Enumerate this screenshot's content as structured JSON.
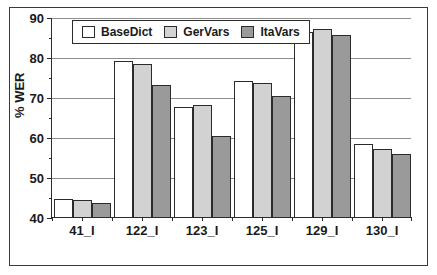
{
  "chart_data": {
    "type": "bar",
    "title": "",
    "subtitle": "",
    "xlabel": "",
    "ylabel": "% WER",
    "ylim": [
      40,
      90
    ],
    "ytick_step": 10,
    "yticks": [
      40,
      50,
      60,
      70,
      80,
      90
    ],
    "ytick_labels": [
      "40",
      "50",
      "60",
      "70",
      "80",
      "90"
    ],
    "grid": "horizontal",
    "legend_position": "top-left-inside",
    "categories": [
      "41_I",
      "122_I",
      "123_I",
      "125_I",
      "129_I",
      "130_I"
    ],
    "series": [
      {
        "name": "BaseDict",
        "color": "#ffffff",
        "values": [
          44.5,
          79.0,
          67.5,
          74.0,
          86.3,
          58.2
        ]
      },
      {
        "name": "GerVars",
        "color": "#d2d2d2",
        "values": [
          44.2,
          78.3,
          68.0,
          73.5,
          87.0,
          57.0
        ]
      },
      {
        "name": "ItaVars",
        "color": "#9a9a9a",
        "values": [
          43.4,
          73.0,
          60.3,
          70.3,
          85.5,
          55.8
        ]
      }
    ]
  },
  "colors": {
    "axis": "#2b2b2b",
    "grid": "#8d8d8d",
    "frame": "#3a3a3a",
    "background": "#ffffff",
    "series_basedict": "#ffffff",
    "series_gervars": "#d2d2d2",
    "series_itavars": "#9a9a9a"
  }
}
